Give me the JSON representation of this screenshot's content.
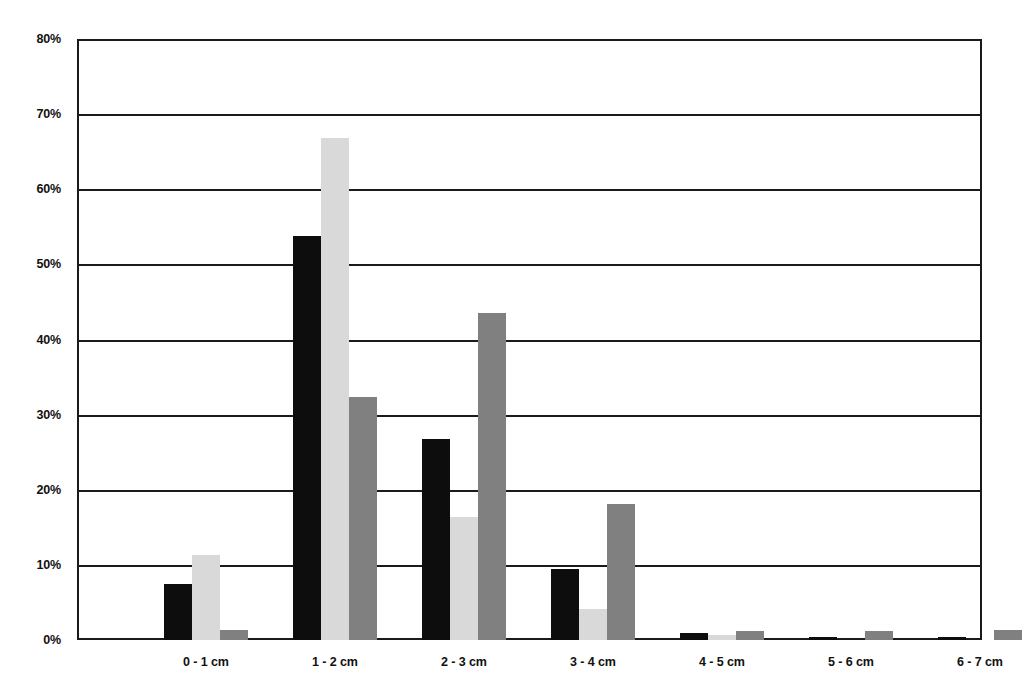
{
  "chart_data": {
    "type": "bar",
    "title": "",
    "subtitle": "",
    "xlabel": "",
    "ylabel": "",
    "categories": [
      "0 - 1 cm",
      "1 - 2 cm",
      "2 - 3 cm",
      "3 - 4 cm",
      "4 - 5 cm",
      "5 - 6 cm",
      "6 - 7 cm"
    ],
    "series": [
      {
        "name": "series-1",
        "color": "#0d0d0d",
        "values": [
          7.5,
          53.8,
          26.8,
          9.5,
          1.0,
          0.4,
          0.4
        ]
      },
      {
        "name": "series-2",
        "color": "#d9d9d9",
        "values": [
          11.3,
          66.8,
          16.4,
          4.1,
          0.7,
          0.0,
          0.0
        ]
      },
      {
        "name": "series-3",
        "color": "#808080",
        "values": [
          1.3,
          32.3,
          43.5,
          18.1,
          1.2,
          1.2,
          1.3
        ]
      }
    ],
    "ylim": [
      0,
      80
    ],
    "ytick_values": [
      0,
      10,
      20,
      30,
      40,
      50,
      60,
      70,
      80
    ],
    "ytick_labels": [
      "0%",
      "10%",
      "20%",
      "30%",
      "40%",
      "50%",
      "60%",
      "70%",
      "80%"
    ],
    "grid": true,
    "grid_axis": "y",
    "legend": false,
    "legend_position": "none",
    "axis_color": "#1a1a1a",
    "background": "#ffffff",
    "annotations": []
  },
  "layout": {
    "plot_left": 77,
    "plot_top": 39,
    "plot_width": 905,
    "plot_height": 601,
    "group_width": 129,
    "bar_width": 28,
    "first_group_center": 129
  }
}
